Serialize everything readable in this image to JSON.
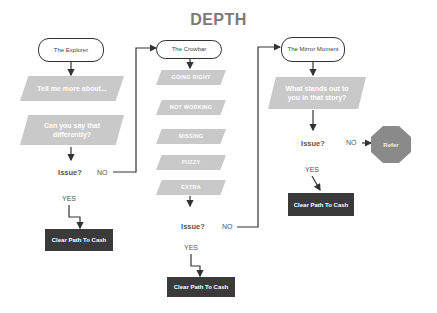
{
  "title": "DEPTH",
  "columns": [
    {
      "terminal": "The Explorer",
      "steps": [
        "Tell me more about...",
        "Can you say that differently?"
      ],
      "decision": "Issue?",
      "no_label": "NO",
      "yes_label": "YES",
      "outcome": "Clear Path To Cash"
    },
    {
      "terminal": "The Crowbar",
      "steps": [
        "GOING RIGHT",
        "NOT WORKING",
        "MISSING",
        "FUZZY",
        "EXTRA"
      ],
      "decision": "Issue?",
      "no_label": "NO",
      "yes_label": "YES",
      "outcome": "Clear Path To Cash"
    },
    {
      "terminal": "The Mirror Moment",
      "steps": [
        "What stands out to you in that story?"
      ],
      "decision": "Issue?",
      "no_label": "NO",
      "yes_label": "YES",
      "outcome": "Clear Path To Cash",
      "stop": "Refer"
    }
  ],
  "colors": {
    "title": "#7a7a7a",
    "step_fill": "#c9c9c9",
    "outcome_fill": "#3a3a3a",
    "stop_fill": "#8a8a8a",
    "line": "#333333"
  }
}
